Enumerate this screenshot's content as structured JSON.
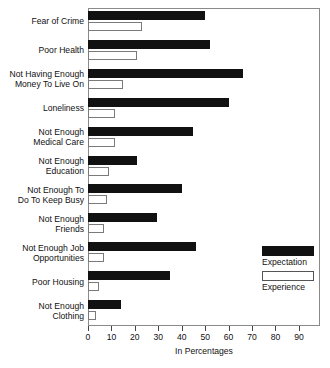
{
  "chart_data": {
    "type": "bar",
    "orientation": "horizontal",
    "title": "",
    "xlabel": "In Percentages",
    "ylabel": "",
    "xlim": [
      0,
      99
    ],
    "xticks": [
      0,
      10,
      20,
      30,
      40,
      50,
      60,
      70,
      80,
      90
    ],
    "xticklabels": [
      "0",
      "10",
      "20",
      "30",
      "40",
      "50",
      "60",
      "70",
      "80",
      "90"
    ],
    "grid": false,
    "legend_position": "right-inside",
    "categories": [
      "Fear of Crime",
      "Poor Health",
      "Not Having Enough Money To Live On",
      "Loneliness",
      "Not Enough Medical Care",
      "Not Enough Education",
      "Not Enough To Do To Keep Busy",
      "Not Enough Friends",
      "Not Enough Job Opportunities",
      "Poor Housing",
      "Not Enough Clothing"
    ],
    "category_lines": [
      [
        "Fear of Crime"
      ],
      [
        "Poor Health"
      ],
      [
        "Not Having Enough",
        "Money To Live On"
      ],
      [
        "Loneliness"
      ],
      [
        "Not Enough",
        "Medical Care"
      ],
      [
        "Not Enough",
        "Education"
      ],
      [
        "Not Enough To",
        "Do To Keep Busy"
      ],
      [
        "Not Enough",
        "Friends"
      ],
      [
        "Not Enough Job",
        "Opportunities"
      ],
      [
        "Poor Housing"
      ],
      [
        "Not Enough",
        "Clothing"
      ]
    ],
    "series": [
      {
        "name": "Expectation",
        "color": "#111111",
        "values": [
          50,
          52,
          66,
          60,
          45,
          21,
          40,
          29.5,
          46,
          35,
          14
        ]
      },
      {
        "name": "Experience",
        "color": "#ffffff",
        "values": [
          23,
          21,
          15,
          11.5,
          11.5,
          9,
          8,
          7,
          7,
          4.5,
          3.5
        ]
      }
    ]
  },
  "legend": {
    "items": [
      {
        "label": "Expectation",
        "swatch": "filled-black"
      },
      {
        "label": "Experience",
        "swatch": "open-white"
      }
    ]
  },
  "axis": {
    "x_title": "In Percentages"
  }
}
